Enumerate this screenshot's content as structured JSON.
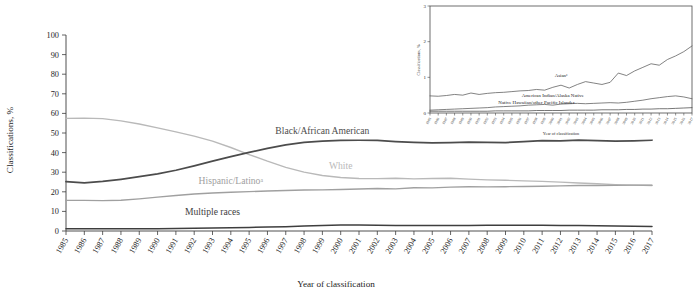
{
  "figure": {
    "type": "line-chart-with-inset",
    "background": "#ffffff"
  },
  "chart_data": {
    "type": "line",
    "title": "",
    "xlabel": "Year of classification",
    "ylabel": "Classifications, %",
    "xlim": [
      1985,
      2017
    ],
    "ylim": [
      0,
      100
    ],
    "grid": false,
    "legend_position": "inline-annotations",
    "x": [
      1985,
      1986,
      1987,
      1988,
      1989,
      1990,
      1991,
      1992,
      1993,
      1994,
      1995,
      1996,
      1997,
      1998,
      1999,
      2000,
      2001,
      2002,
      2003,
      2004,
      2005,
      2006,
      2007,
      2008,
      2009,
      2010,
      2011,
      2012,
      2013,
      2014,
      2015,
      2016,
      2017
    ],
    "ytick_labels": [
      "0",
      "10",
      "20",
      "30",
      "40",
      "50",
      "60",
      "70",
      "80",
      "90",
      "100"
    ],
    "ytick_values": [
      0,
      10,
      20,
      30,
      40,
      50,
      60,
      70,
      80,
      90,
      100
    ],
    "xtick_labels": [
      "1985",
      "1986",
      "1987",
      "1988",
      "1989",
      "1990",
      "1991",
      "1992",
      "1993",
      "1994",
      "1995",
      "1996",
      "1997",
      "1998",
      "1999",
      "2000",
      "2001",
      "2002",
      "2003",
      "2004",
      "2005",
      "2006",
      "2007",
      "2008",
      "2009",
      "2010",
      "2011",
      "2012",
      "2013",
      "2014",
      "2015",
      "2016",
      "2017"
    ],
    "series": [
      {
        "name": "White",
        "label": "White",
        "color": "#b9b9b9",
        "stroke_width": 1.35,
        "label_x": 2000,
        "label_y": 31.5,
        "values": [
          57.5,
          57.6,
          57.3,
          56.2,
          54.6,
          52.6,
          50.6,
          48.4,
          45.9,
          42.6,
          39.0,
          35.6,
          32.5,
          30.0,
          28.3,
          27.3,
          26.8,
          26.7,
          26.9,
          26.6,
          26.8,
          26.9,
          26.5,
          26.1,
          25.9,
          25.6,
          25.3,
          24.9,
          24.5,
          24.1,
          23.7,
          23.4,
          23.2
        ]
      },
      {
        "name": "Black/African American",
        "label": "Black/African American",
        "color": "#4c4c4c",
        "stroke_width": 1.75,
        "label_x": 1999,
        "label_y": 49.5,
        "values": [
          25.2,
          24.6,
          25.3,
          26.4,
          27.7,
          29.2,
          31.0,
          33.2,
          35.6,
          37.9,
          40.1,
          42.2,
          43.9,
          45.2,
          45.9,
          46.2,
          46.3,
          46.2,
          45.6,
          45.2,
          45.0,
          45.1,
          45.4,
          45.2,
          45.1,
          45.6,
          46.1,
          46.0,
          46.4,
          46.1,
          45.9,
          46.0,
          46.3
        ]
      },
      {
        "name": "Hispanic/Latino",
        "label": "Hispanic/Latinoᵃ",
        "color": "#a0a0a0",
        "stroke_width": 1.4,
        "label_x": 1994,
        "label_y": 24.2,
        "values": [
          15.6,
          15.6,
          15.5,
          15.7,
          16.4,
          17.3,
          18.1,
          18.9,
          19.4,
          19.8,
          20.1,
          20.4,
          20.7,
          20.9,
          21.0,
          21.2,
          21.4,
          21.7,
          21.5,
          22.1,
          22.0,
          22.4,
          22.6,
          22.5,
          22.6,
          22.7,
          22.8,
          23.0,
          23.2,
          23.2,
          23.3,
          23.4,
          23.4
        ]
      },
      {
        "name": "Multiple races",
        "label": "Multiple races",
        "color": "#3e3e3e",
        "stroke_width": 1.5,
        "label_x": 1993,
        "label_y": 8.0,
        "values": [
          1.1,
          1.1,
          1.1,
          1.1,
          1.2,
          1.2,
          1.3,
          1.4,
          1.5,
          1.6,
          1.8,
          2.0,
          2.2,
          2.5,
          2.8,
          3.0,
          3.0,
          2.9,
          2.8,
          2.8,
          2.8,
          2.8,
          2.8,
          2.9,
          2.9,
          2.9,
          2.9,
          2.8,
          2.8,
          2.7,
          2.6,
          2.4,
          2.3
        ]
      }
    ]
  },
  "inset_chart_data": {
    "type": "line",
    "title": "",
    "xlabel": "Year of classification",
    "ylabel": "Classifications, %",
    "xlim": [
      1985,
      2017
    ],
    "ylim": [
      0,
      3
    ],
    "grid": false,
    "legend_position": "inline-annotations",
    "ytick_labels": [
      "0",
      "1",
      "2",
      "3"
    ],
    "ytick_values": [
      0,
      1,
      2,
      3
    ],
    "x": [
      1985,
      1986,
      1987,
      1988,
      1989,
      1990,
      1991,
      1992,
      1993,
      1994,
      1995,
      1996,
      1997,
      1998,
      1999,
      2000,
      2001,
      2002,
      2003,
      2004,
      2005,
      2006,
      2007,
      2008,
      2009,
      2010,
      2011,
      2012,
      2013,
      2014,
      2015,
      2016,
      2017
    ],
    "xtick_labels": [
      "1985",
      "1986",
      "1987",
      "1988",
      "1989",
      "1990",
      "1991",
      "1992",
      "1993",
      "1994",
      "1995",
      "1996",
      "1997",
      "1998",
      "1999",
      "2000",
      "2001",
      "2002",
      "2003",
      "2004",
      "2005",
      "2006",
      "2007",
      "2008",
      "2009",
      "2010",
      "2011",
      "2012",
      "2013",
      "2014",
      "2015",
      "2016",
      "2017"
    ],
    "series": [
      {
        "name": "Asian",
        "label": "Asianᵃ",
        "color": "#5a5a5a",
        "label_x": 2001,
        "label_y": 1.02,
        "values": [
          0.48,
          0.47,
          0.49,
          0.52,
          0.5,
          0.56,
          0.52,
          0.55,
          0.57,
          0.58,
          0.6,
          0.62,
          0.63,
          0.66,
          0.64,
          0.72,
          0.78,
          0.7,
          0.8,
          0.88,
          0.84,
          0.8,
          0.86,
          1.12,
          1.05,
          1.18,
          1.28,
          1.38,
          1.34,
          1.5,
          1.6,
          1.72,
          1.88
        ]
      },
      {
        "name": "American Indian/Alaska Native",
        "label": "American Indian/Alaska Native",
        "color": "#5a5a5a",
        "label_x": 2000,
        "label_y": 0.44,
        "values": [
          0.08,
          0.09,
          0.1,
          0.11,
          0.12,
          0.13,
          0.14,
          0.15,
          0.17,
          0.18,
          0.19,
          0.2,
          0.22,
          0.23,
          0.24,
          0.22,
          0.25,
          0.26,
          0.27,
          0.26,
          0.27,
          0.28,
          0.29,
          0.28,
          0.3,
          0.33,
          0.36,
          0.4,
          0.43,
          0.46,
          0.48,
          0.45,
          0.4
        ]
      },
      {
        "name": "Native Hawaiian/other Pacific Islander",
        "label": "Native Hawaiian/other Pacific Islander",
        "color": "#4a4a4a",
        "label_x": 1998,
        "label_y": 0.25,
        "values": [
          0.05,
          0.05,
          0.05,
          0.05,
          0.05,
          0.05,
          0.05,
          0.05,
          0.06,
          0.06,
          0.06,
          0.06,
          0.06,
          0.07,
          0.07,
          0.07,
          0.07,
          0.08,
          0.08,
          0.08,
          0.08,
          0.09,
          0.09,
          0.09,
          0.1,
          0.1,
          0.11,
          0.11,
          0.12,
          0.12,
          0.13,
          0.14,
          0.15
        ]
      }
    ]
  }
}
